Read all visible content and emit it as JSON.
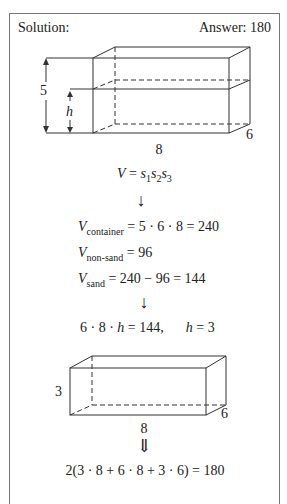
{
  "header": {
    "left": "Solution:",
    "right": "Answer: 180"
  },
  "figure1": {
    "height_label": "5",
    "h_label": "h",
    "length_label": "8",
    "width_label": "6"
  },
  "steps": {
    "formula": {
      "lhs": "V",
      "eq": " = ",
      "s": "s",
      "i1": "1",
      "i2": "2",
      "i3": "3"
    },
    "arrow1": "↓",
    "v_container": {
      "v": "V",
      "sub": "container",
      "rhs": " = 5 · 6 · 8 = 240"
    },
    "v_nonsand": {
      "v": "V",
      "sub": "non-sand",
      "rhs": " = 96"
    },
    "v_sand": {
      "v": "V",
      "sub": "sand",
      "rhs": " = 240 − 96 = 144"
    },
    "arrow2": "↓",
    "solve": {
      "a": "6 · 8 · ",
      "h": "h",
      "b": " = 144,",
      "c": "h",
      "d": " = 3"
    }
  },
  "figure2": {
    "height_label": "3",
    "length_label": "8",
    "width_label": "6"
  },
  "arrow3": "⇓",
  "final": "2(3 · 8 + 6 · 8 + 3 · 6) = 180"
}
